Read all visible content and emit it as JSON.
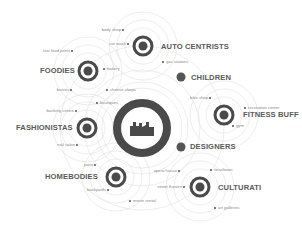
{
  "diagram": {
    "center": {
      "icon": "factory-skyline-icon"
    },
    "segments": [
      {
        "key": "auto",
        "label": "AUTO CENTRISTS",
        "places": [
          "body shop",
          "car wash",
          "gas stations"
        ]
      },
      {
        "key": "foodies",
        "label": "FOODIES",
        "places": [
          "fast food joints",
          "bakery",
          "bistros"
        ]
      },
      {
        "key": "fashion",
        "label": "FASHIONISTAS",
        "places": [
          "banking centre",
          "nail salon",
          "boutiques",
          "cheese shops"
        ]
      },
      {
        "key": "home",
        "label": "HOMEBODIES",
        "places": [
          "patio",
          "backyards",
          "movie rental"
        ]
      },
      {
        "key": "culturati",
        "label": "CULTURATI",
        "places": [
          "opera house",
          "street theatre",
          "tinseltown",
          "art galleries"
        ]
      },
      {
        "key": "fitness",
        "label": "FITNESS BUFF",
        "places": [
          "bike shop",
          "recreation center",
          "gym"
        ]
      },
      {
        "key": "children",
        "label": "CHILDREN",
        "places": []
      },
      {
        "key": "designers",
        "label": "DESIGNERS",
        "places": []
      }
    ]
  },
  "colors": {
    "ring": "#4a4a4a",
    "dot": "#555555",
    "guide": "#dcdcdc",
    "label": "#5a5a5a",
    "sublabel": "#8a8a8a"
  }
}
